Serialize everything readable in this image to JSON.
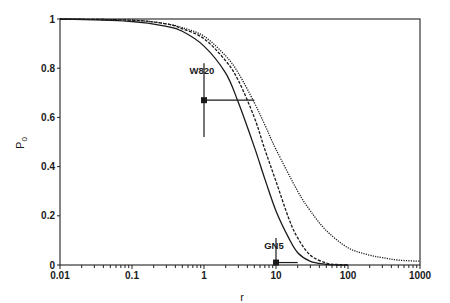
{
  "chart_data": {
    "type": "line",
    "title": "",
    "xlabel": "r",
    "ylabel": "P0",
    "xscale": "log",
    "xlim": [
      0.01,
      1000
    ],
    "ylim": [
      0,
      1
    ],
    "grid": false,
    "legend": "none",
    "x_ticks": [
      "0.01",
      "0.1",
      "1",
      "10",
      "100",
      "1000"
    ],
    "y_ticks": [
      "0",
      "0.2",
      "0.4",
      "0.6",
      "0.8",
      "1"
    ],
    "series": [
      {
        "name": "curve-solid",
        "style": "solid",
        "x": [
          0.01,
          0.1,
          0.3,
          0.5,
          1,
          2,
          3,
          5,
          7,
          10,
          15,
          20,
          30,
          50,
          70,
          100
        ],
        "y": [
          1.0,
          0.99,
          0.97,
          0.95,
          0.89,
          0.78,
          0.66,
          0.48,
          0.35,
          0.22,
          0.11,
          0.05,
          0.015,
          0.003,
          0.0,
          0.0
        ]
      },
      {
        "name": "curve-dashed",
        "style": "dashed",
        "x": [
          0.01,
          0.1,
          0.3,
          0.5,
          1,
          2,
          3,
          5,
          7,
          10,
          15,
          20,
          30,
          50,
          70,
          100
        ],
        "y": [
          1.0,
          0.995,
          0.98,
          0.96,
          0.92,
          0.83,
          0.75,
          0.6,
          0.47,
          0.34,
          0.19,
          0.11,
          0.04,
          0.008,
          0.002,
          0.0
        ]
      },
      {
        "name": "curve-dotted",
        "style": "dotted",
        "x": [
          0.01,
          0.1,
          0.3,
          0.5,
          1,
          2,
          3,
          5,
          7,
          10,
          20,
          30,
          50,
          100,
          200,
          300,
          500,
          1000
        ],
        "y": [
          1.0,
          0.995,
          0.98,
          0.965,
          0.93,
          0.85,
          0.78,
          0.66,
          0.57,
          0.47,
          0.3,
          0.22,
          0.14,
          0.07,
          0.04,
          0.03,
          0.02,
          0.015
        ]
      }
    ],
    "annotations": [
      {
        "label": "W820",
        "x": 1.0,
        "y": 0.67,
        "y_err": [
          0.52,
          0.82
        ],
        "x_err": [
          1.0,
          5.0
        ]
      },
      {
        "label": "GN5",
        "x": 10.0,
        "y": 0.01,
        "y_err": [
          0.0,
          0.11
        ],
        "x_err": [
          10.0,
          20.0
        ]
      }
    ]
  }
}
